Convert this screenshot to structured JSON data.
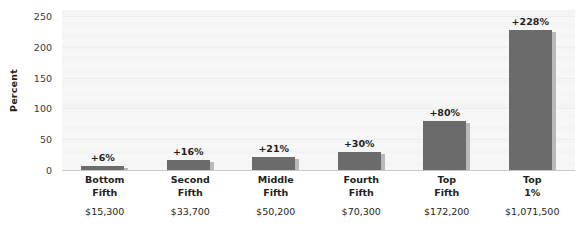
{
  "chart_data": {
    "type": "bar",
    "title": "",
    "xlabel": "",
    "ylabel": "Percent",
    "ylim": [
      0,
      260
    ],
    "yticks": [
      0,
      50,
      100,
      150,
      200,
      250
    ],
    "ytick_labels": [
      "0",
      "50",
      "100",
      "150",
      "200",
      "250"
    ],
    "grid": true,
    "legend": "none",
    "categories": [
      "Bottom\nFifth",
      "Second\nFifth",
      "Middle\nFifth",
      "Fourth\nFifth",
      "Top\nFifth",
      "Top\n1%"
    ],
    "values": [
      6,
      16,
      21,
      30,
      80,
      228
    ],
    "value_labels": [
      "+6%",
      "+16%",
      "+21%",
      "+30%",
      "+80%",
      "+228%"
    ],
    "secondary_labels": [
      "$15,300",
      "$33,700",
      "$50,200",
      "$70,300",
      "$172,200",
      "$1,071,500"
    ],
    "bar_color": "#6b6b6b",
    "bar_shadow_color": "#b9b9b9",
    "plot_background": "#f7f7f7"
  },
  "axis": {
    "y_title": "Percent"
  },
  "categories": [
    {
      "line1": "Bottom",
      "line2": "Fifth",
      "amount": "$15,300",
      "value_label": "+6%"
    },
    {
      "line1": "Second",
      "line2": "Fifth",
      "amount": "$33,700",
      "value_label": "+16%"
    },
    {
      "line1": "Middle",
      "line2": "Fifth",
      "amount": "$50,200",
      "value_label": "+21%"
    },
    {
      "line1": "Fourth",
      "line2": "Fifth",
      "amount": "$70,300",
      "value_label": "+30%"
    },
    {
      "line1": "Top",
      "line2": "Fifth",
      "amount": "$172,200",
      "value_label": "+80%"
    },
    {
      "line1": "Top",
      "line2": "1%",
      "amount": "$1,071,500",
      "value_label": "+228%"
    }
  ]
}
